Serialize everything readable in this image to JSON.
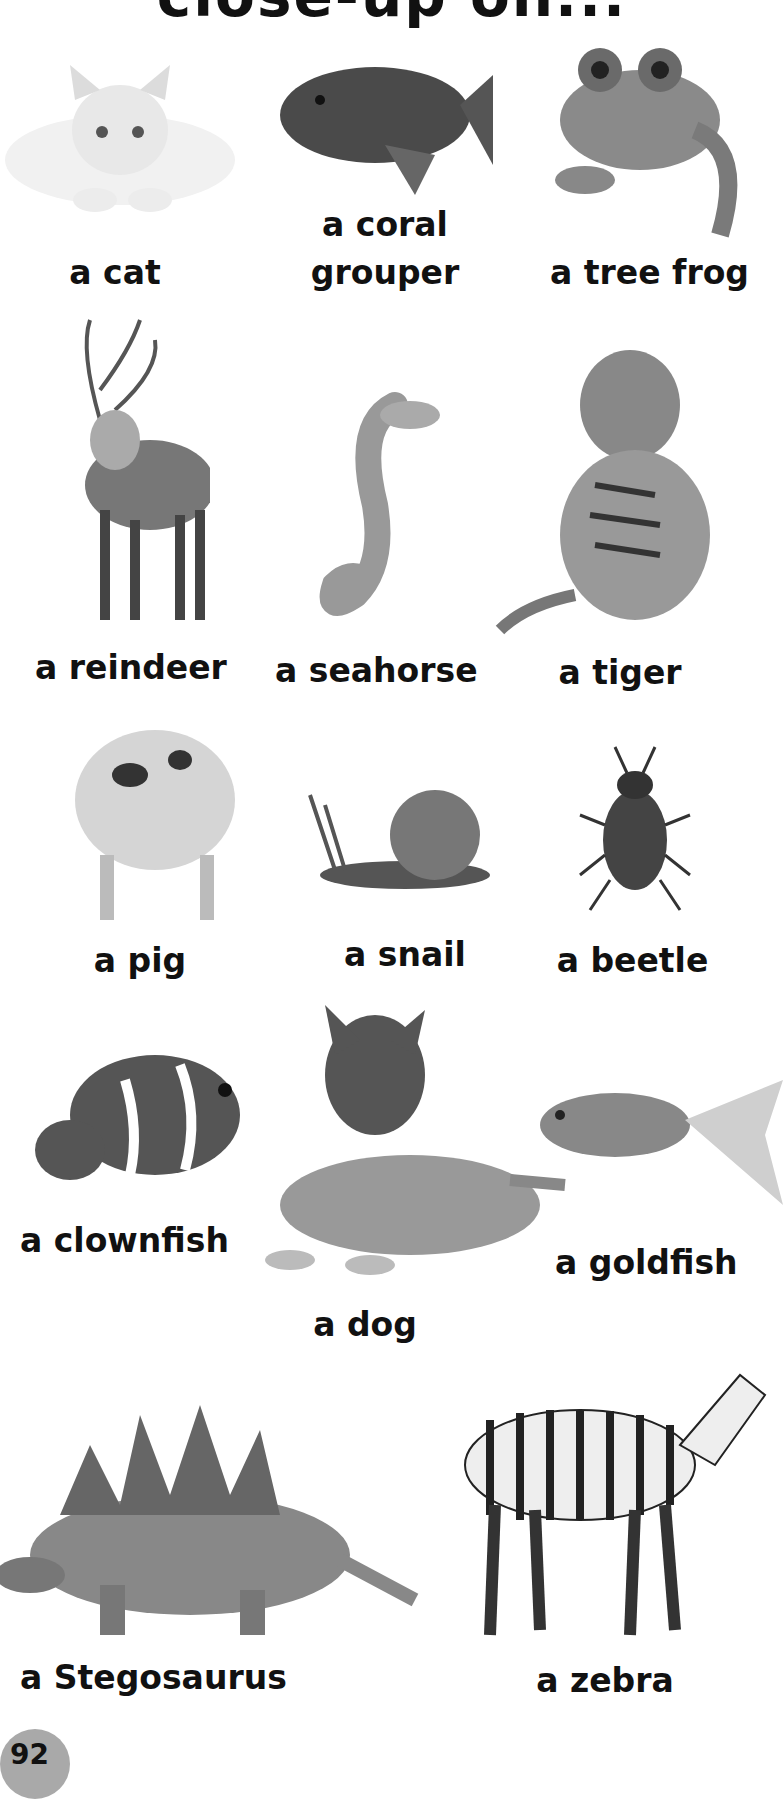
{
  "page": {
    "title": "close-up on...",
    "page_number": "92"
  },
  "animals": [
    {
      "id": "cat",
      "label": "a cat"
    },
    {
      "id": "coral-grouper",
      "label_line1": "a coral",
      "label_line2": "grouper"
    },
    {
      "id": "tree-frog",
      "label": "a tree frog"
    },
    {
      "id": "reindeer",
      "label": "a reindeer"
    },
    {
      "id": "seahorse",
      "label": "a seahorse"
    },
    {
      "id": "tiger",
      "label": "a tiger"
    },
    {
      "id": "pig",
      "label": "a pig"
    },
    {
      "id": "snail",
      "label": "a snail"
    },
    {
      "id": "beetle",
      "label": "a beetle"
    },
    {
      "id": "clownfish",
      "label": "a clownfish"
    },
    {
      "id": "dog",
      "label": "a dog"
    },
    {
      "id": "goldfish",
      "label": "a goldfish"
    },
    {
      "id": "stegosaurus",
      "label": "a Stegosaurus"
    },
    {
      "id": "zebra",
      "label": "a zebra"
    }
  ]
}
